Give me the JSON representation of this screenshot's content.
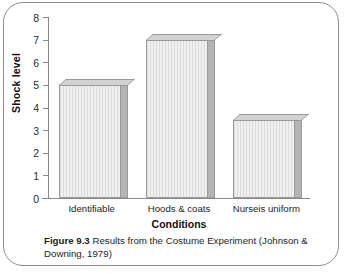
{
  "figure": {
    "caption_label": "Figure 9.3",
    "caption_text": "Results from the Costume Experiment (Johnson & Downing, 1979)"
  },
  "chart_data": {
    "type": "bar",
    "title": "",
    "categories": [
      "Identifiable",
      "Hoods & coats",
      "Nurseis uniform"
    ],
    "values": [
      5,
      7,
      3.45
    ],
    "xlabel": "Conditions",
    "ylabel": "Shock level",
    "ylim": [
      0,
      8
    ],
    "yticks": [
      0,
      1,
      2,
      3,
      4,
      5,
      6,
      7,
      8
    ],
    "ytick_labels": [
      "0",
      "1",
      "2",
      "3",
      "4",
      "5",
      "6",
      "7",
      "8"
    ],
    "grid": false,
    "legend": "none",
    "style": "3d-bars",
    "bar_fill_color": "#e2e2e2",
    "bar_side_color": "#b4b4b4",
    "bar_edge_color": "#9a9a9a",
    "axis_color": "#8a8a8a",
    "frame_color": "#8d8d8d"
  }
}
